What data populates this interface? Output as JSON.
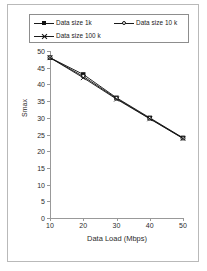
{
  "chart_data": {
    "type": "line",
    "title": "",
    "xlabel": "Data Load (Mbps)",
    "ylabel": "Smax",
    "x": [
      10,
      20,
      30,
      40,
      50
    ],
    "xlim": [
      10,
      50
    ],
    "ylim": [
      0,
      50
    ],
    "xticks": [
      "10",
      "20",
      "30",
      "40",
      "50"
    ],
    "yticks": [
      "0",
      "5",
      "10",
      "15",
      "20",
      "25",
      "30",
      "35",
      "40",
      "45",
      "50"
    ],
    "grid": false,
    "legend_position": "top",
    "series": [
      {
        "name": "Data size 1k",
        "marker": "filled-square",
        "color": "#111111",
        "values": [
          48,
          43,
          36,
          30,
          24
        ]
      },
      {
        "name": "Data size 10 k",
        "marker": "hollow-circle",
        "color": "#111111",
        "values": [
          48,
          42.4,
          35.8,
          29.8,
          23.9
        ]
      },
      {
        "name": "Data size 100 k",
        "marker": "x-star",
        "color": "#111111",
        "values": [
          48,
          42,
          35.6,
          29.7,
          23.8
        ]
      }
    ]
  },
  "legend": {
    "items": [
      {
        "label": "Data size 1k",
        "icon": "filled-square-marker-icon"
      },
      {
        "label": "Data size 10 k",
        "icon": "hollow-circle-marker-icon"
      },
      {
        "label": "Data size 100 k",
        "icon": "x-star-marker-icon"
      }
    ]
  },
  "axes": {
    "y_title": "Smax",
    "x_title": "Data Load (Mbps)",
    "y_tick_labels": [
      "50",
      "45",
      "40",
      "35",
      "30",
      "25",
      "20",
      "15",
      "10",
      "5",
      "0"
    ],
    "x_tick_labels": [
      "10",
      "20",
      "30",
      "40",
      "50"
    ]
  },
  "colors": {
    "line": "#111111",
    "axis": "#999999",
    "frame": "#b9b9b9",
    "legend_border": "#8d8d8d",
    "background": "#ffffff",
    "text": "#2b2b2b"
  }
}
